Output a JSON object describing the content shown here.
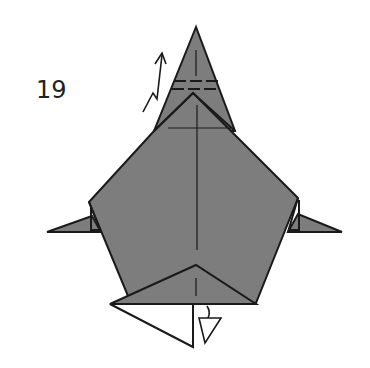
{
  "diagram": {
    "step_number": "19",
    "colors": {
      "paper_colored": "#7d7d7d",
      "paper_white": "#ffffff",
      "line": "#1a1a1a"
    },
    "elements": [
      "top-point-flap",
      "valley-fold-dashed-lines",
      "mountain-pleat-arrow",
      "pentagon-body",
      "left-side-point",
      "right-side-point",
      "center-crease-line",
      "bottom-triangle-flap",
      "white-reverse-flap",
      "push-arrow"
    ]
  }
}
